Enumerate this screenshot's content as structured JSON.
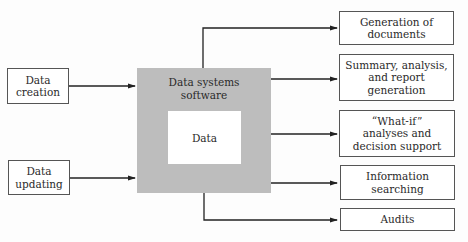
{
  "diagram": {
    "inputs": [
      {
        "label": "Data\ncreation"
      },
      {
        "label": "Data\nupdating"
      }
    ],
    "center": {
      "outer_label": "Data systems\nsoftware",
      "inner_label": "Data",
      "fill_color": "#bdbdbd"
    },
    "outputs": [
      {
        "label": "Generation of\ndocuments"
      },
      {
        "label": "Summary, analysis,\nand report\ngeneration"
      },
      {
        "label": "“What-if”\nanalyses and\ndecision support"
      },
      {
        "label": "Information\nsearching"
      },
      {
        "label": "Audits"
      }
    ]
  }
}
